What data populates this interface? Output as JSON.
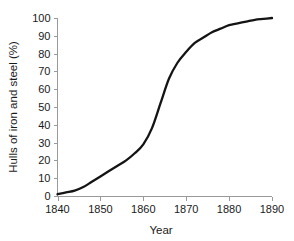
{
  "chart_data": {
    "type": "line",
    "title": "",
    "xlabel": "Year",
    "ylabel": "Hulls of iron and steel (%)",
    "xlim": [
      1840,
      1890
    ],
    "ylim": [
      0,
      100
    ],
    "grid": false,
    "legend": null,
    "xticks": [
      "1840",
      "1850",
      "1860",
      "1870",
      "1880",
      "1890"
    ],
    "xtick_values": [
      1840,
      1850,
      1860,
      1870,
      1880,
      1890
    ],
    "yticks": [
      "0",
      "10",
      "20",
      "30",
      "40",
      "50",
      "60",
      "70",
      "80",
      "90",
      "100"
    ],
    "ytick_values": [
      0,
      10,
      20,
      30,
      40,
      50,
      60,
      70,
      80,
      90,
      100
    ],
    "series": [
      {
        "name": "Hulls of iron and steel",
        "color": "#141414",
        "x": [
          1840,
          1842,
          1844,
          1846,
          1848,
          1850,
          1852,
          1854,
          1856,
          1858,
          1860,
          1862,
          1864,
          1866,
          1868,
          1870,
          1872,
          1874,
          1876,
          1878,
          1880,
          1882,
          1884,
          1886,
          1888,
          1890
        ],
        "values": [
          1,
          2,
          3,
          5,
          8,
          11,
          14,
          17,
          20,
          24,
          29,
          38,
          52,
          66,
          75,
          81,
          86,
          89,
          92,
          94,
          96,
          97,
          98,
          99,
          99.5,
          100
        ]
      }
    ],
    "annotations": []
  },
  "axis_style": {
    "line_color": "#9a9a9a",
    "tick_color": "#9a9a9a",
    "text_color": "#1a1a1a"
  }
}
